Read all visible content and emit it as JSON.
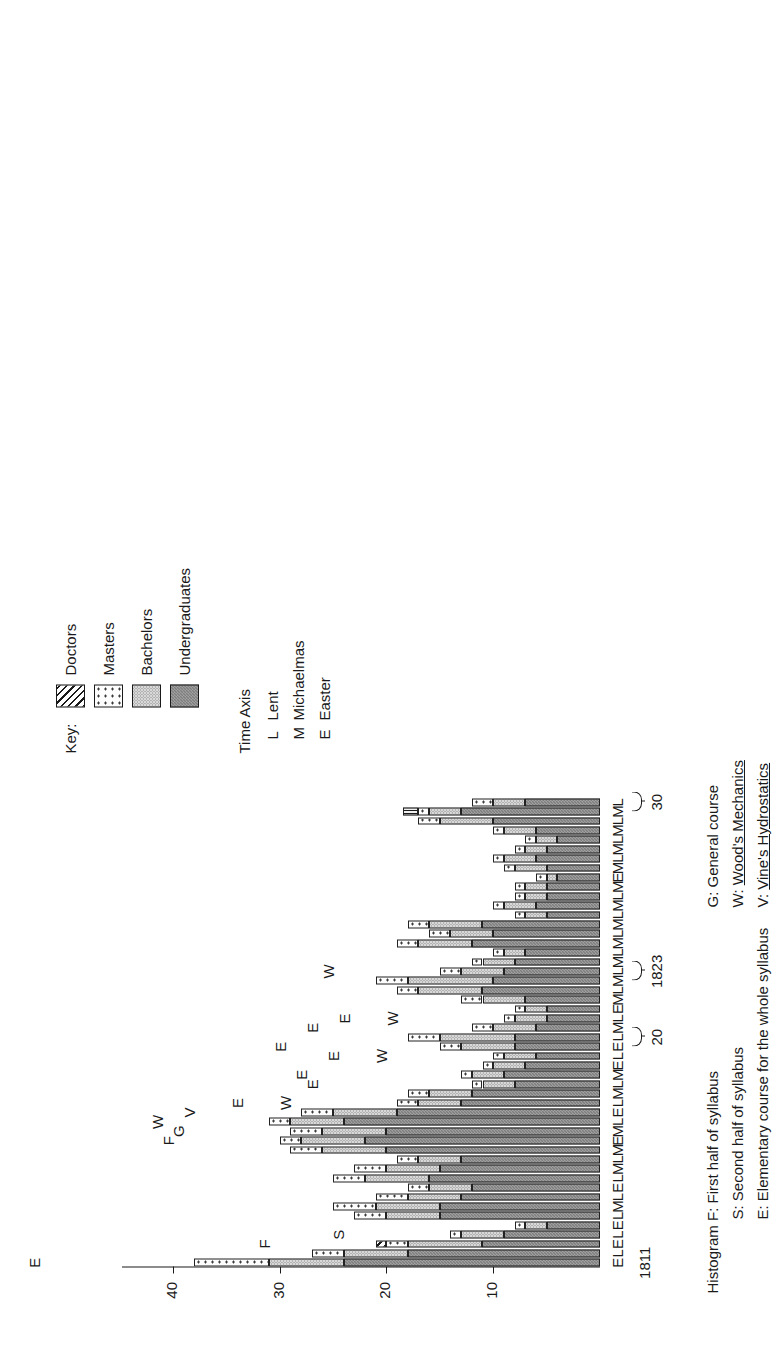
{
  "key": {
    "title": "Key:",
    "items": [
      {
        "label": "Doctors",
        "pattern": "diagonal-hatch"
      },
      {
        "label": "Masters",
        "pattern": "open-dots"
      },
      {
        "label": "Bachelors",
        "pattern": "light-dots"
      },
      {
        "label": "Undergraduates",
        "pattern": "dark-check"
      }
    ]
  },
  "time_axis": {
    "title": "Time Axis",
    "items": [
      {
        "code": "L",
        "label": "Lent"
      },
      {
        "code": "M",
        "label": "Michaelmas"
      },
      {
        "code": "E",
        "label": "Easter"
      }
    ]
  },
  "footnotes_left": [
    "Histogram F: First half of syllabus",
    "S: Second half of syllabus",
    "E: Elementary course for the whole syllabus"
  ],
  "footnotes_right": [
    "G: General course",
    "W: Wood's Mechanics",
    "V: Vine's Hydrostatics"
  ],
  "footnotes_right_underline": [
    false,
    true,
    true
  ],
  "year_marks": [
    {
      "label": "1811",
      "index": 0,
      "brace": false
    },
    {
      "label": "20",
      "index": 24,
      "brace": true
    },
    {
      "label": "1823",
      "index": 31,
      "brace": true
    },
    {
      "label": "30",
      "index": 49,
      "brace": true
    }
  ],
  "chart_data": {
    "type": "bar",
    "subtype": "stacked-vertical-histogram",
    "title": "",
    "xlabel": "Time Axis",
    "ylabel": "",
    "ylim": [
      0,
      44
    ],
    "yticks": [
      10,
      20,
      30,
      40
    ],
    "grid": false,
    "legend_position": "top-right",
    "series": [
      {
        "name": "Undergraduates",
        "pattern": "dark-check",
        "color": "#7e7e7e"
      },
      {
        "name": "Bachelors",
        "pattern": "light-dots",
        "color": "#d8d8d8"
      },
      {
        "name": "Masters",
        "pattern": "open-dots",
        "color": "#fdfdfd"
      },
      {
        "name": "Doctors",
        "pattern": "diagonal-hatch",
        "color": "#e9e9e9"
      }
    ],
    "categories": [
      "E",
      "L",
      "E",
      "L",
      "E",
      "L",
      "M",
      "L",
      "E",
      "L",
      "M",
      "L",
      "M",
      "E",
      "M",
      "L",
      "E",
      "L",
      "M",
      "L",
      "M",
      "E",
      "L",
      "E",
      "L",
      "M",
      "L",
      "E",
      "M",
      "L",
      "M",
      "L",
      "M",
      "L",
      "M",
      "L",
      "M",
      "L",
      "M",
      "L",
      "M",
      "E",
      "M",
      "L",
      "M",
      "L",
      "M",
      "L",
      "M",
      "L"
    ],
    "annotations": [
      "",
      "",
      "F",
      "S",
      "",
      "",
      "",
      "",
      "",
      "",
      "",
      "",
      "",
      "F",
      "G",
      "W",
      "V",
      "W",
      "",
      "",
      "",
      "",
      "W",
      "",
      "",
      "",
      "W",
      "",
      "",
      "",
      "",
      "W",
      "",
      "",
      "",
      "",
      "",
      "",
      "",
      "",
      "",
      "",
      "",
      "",
      "",
      "",
      "",
      "",
      "",
      ""
    ],
    "above_letters": [
      "E",
      "",
      "",
      "",
      "",
      "",
      "",
      "",
      "",
      "",
      "",
      "",
      "",
      "",
      "",
      "",
      "",
      "E",
      "",
      "E",
      "E",
      "",
      "E",
      "E",
      "",
      "E",
      "E",
      "",
      "",
      "",
      "",
      "",
      "",
      "",
      "",
      "",
      "",
      "",
      "",
      "",
      "",
      "",
      "",
      "",
      "",
      "",
      "",
      "",
      "",
      ""
    ],
    "values": {
      "Undergraduates": [
        24,
        18,
        11,
        9,
        5,
        15,
        15,
        13,
        12,
        16,
        15,
        13,
        20,
        22,
        20,
        24,
        19,
        13,
        12,
        8,
        9,
        7,
        6,
        8,
        8,
        6,
        5,
        5,
        7,
        11,
        10,
        9,
        8,
        7,
        12,
        10,
        11,
        5,
        6,
        5,
        5,
        4,
        5,
        6,
        5,
        4,
        6,
        10,
        13,
        7
      ],
      "Bachelors": [
        7,
        6,
        7,
        4,
        2,
        5,
        6,
        5,
        4,
        6,
        5,
        4,
        6,
        6,
        6,
        5,
        6,
        4,
        4,
        3,
        3,
        3,
        3,
        5,
        7,
        4,
        3,
        2,
        4,
        6,
        8,
        4,
        3,
        2,
        5,
        4,
        5,
        2,
        3,
        2,
        2,
        1,
        3,
        3,
        2,
        2,
        3,
        5,
        3,
        3
      ],
      "Masters": [
        7,
        3,
        2,
        1,
        1,
        3,
        4,
        3,
        2,
        3,
        3,
        2,
        3,
        2,
        3,
        2,
        3,
        2,
        2,
        1,
        1,
        1,
        1,
        2,
        3,
        2,
        1,
        1,
        2,
        2,
        3,
        2,
        1,
        1,
        2,
        2,
        2,
        1,
        1,
        1,
        1,
        1,
        1,
        1,
        1,
        1,
        1,
        2,
        1,
        2
      ],
      "Doctors": [
        0,
        0,
        1,
        0,
        0,
        0,
        0,
        0,
        0,
        0,
        0,
        0,
        0,
        0,
        0,
        0,
        0,
        0,
        0,
        0,
        0,
        0,
        0,
        0,
        0,
        0,
        0,
        0,
        0,
        0,
        0,
        0,
        0,
        0,
        0,
        0,
        0,
        0,
        0,
        0,
        0,
        0,
        0,
        0,
        0,
        0,
        0,
        0,
        0,
        0
      ]
    }
  }
}
